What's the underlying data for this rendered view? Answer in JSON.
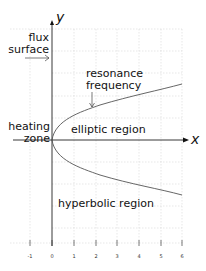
{
  "diagram": {
    "axes": {
      "x_label": "x",
      "y_label": "y",
      "x_ticks": [
        "-1",
        "0",
        "1",
        "2",
        "3",
        "4",
        "5",
        "6"
      ]
    },
    "labels": {
      "flux_surface_line1": "flux",
      "flux_surface_line2": "surface",
      "resonance_line1": "resonance",
      "resonance_line2": "frequency",
      "heating_line1": "heating",
      "heating_line2": "zone",
      "elliptic": "elliptic region",
      "hyperbolic": "hyperbolic region"
    },
    "colors": {
      "grid": "#d4d4d4",
      "axis": "#222222",
      "curve": "#555555",
      "text": "#111111"
    }
  }
}
